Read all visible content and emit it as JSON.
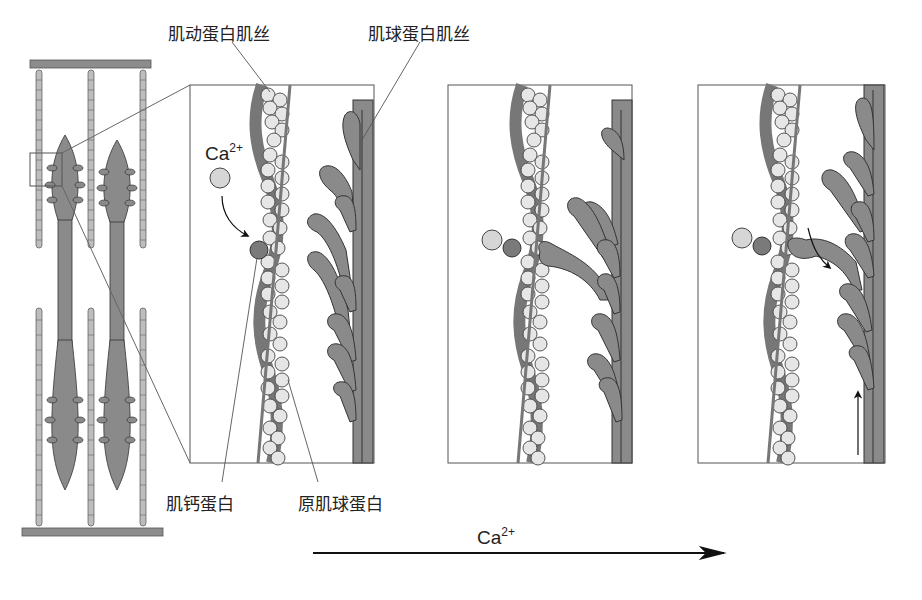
{
  "labels": {
    "actin_filament": "肌动蛋白肌丝",
    "myosin_filament": "肌球蛋白肌丝",
    "troponin": "肌钙蛋白",
    "tropomyosin": "原肌球蛋白"
  },
  "calcium": {
    "base": "Ca",
    "charge": "2+"
  },
  "arrow_label": {
    "base": "Ca",
    "charge": "2+"
  },
  "colors": {
    "myosin": "#8a8a8a",
    "actin_bead": "#e6e6e6",
    "outline": "#333333",
    "calcium": "#d6d6d6",
    "troponin": "#7a7a7a",
    "z_line": "#8c8c8c"
  },
  "panels": [
    {
      "name": "resting",
      "x": 190,
      "y": 85,
      "w": 184,
      "h": 378
    },
    {
      "name": "calcium-bound",
      "x": 448,
      "y": 85,
      "w": 184,
      "h": 378
    },
    {
      "name": "power-stroke",
      "x": 698,
      "y": 85,
      "w": 187,
      "h": 378
    }
  ]
}
